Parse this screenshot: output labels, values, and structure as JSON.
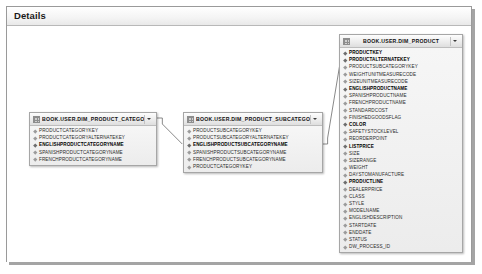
{
  "panel": {
    "title": "Details"
  },
  "icons": {
    "grid": "grid-icon",
    "caret": "chevron-down-icon",
    "field_marker": "field-marker-icon"
  },
  "colors": {
    "panel_border": "#9a9a9a",
    "entity_border": "#a6a6a6",
    "entity_header_start": "#fdfdfd",
    "entity_header_end": "#dedede",
    "entity_body": "#f2f2f2",
    "connector_line": "#6b6b6b",
    "text": "#2b2b2b",
    "key_text": "#000000"
  },
  "diagram": {
    "type": "entity-relationship",
    "entities": [
      {
        "id": "dim_product_category",
        "title": "BOOK.USER.DIM_PRODUCT_CATEGORY",
        "fields": [
          {
            "name": "PRODUCTCATEGORYKEY",
            "key": false
          },
          {
            "name": "PRODUCTCATEGORYALTERNATEKEY",
            "key": false
          },
          {
            "name": "ENGLISHPRODUCTCATEGORYNAME",
            "key": true
          },
          {
            "name": "SPANISHPRODUCTCATEGORYNAME",
            "key": false
          },
          {
            "name": "FRENCHPRODUCTCATEGORYNAME",
            "key": false
          }
        ]
      },
      {
        "id": "dim_product_subcategory",
        "title": "BOOK.USER.DIM_PRODUCT_SUBCATEGORY",
        "fields": [
          {
            "name": "PRODUCTSUBCATEGORYKEY",
            "key": false
          },
          {
            "name": "PRODUCTSUBCATEGORYALTERNATEKEY",
            "key": false
          },
          {
            "name": "ENGLISHPRODUCTSUBCATEGORYNAME",
            "key": true
          },
          {
            "name": "SPANISHPRODUCTSUBCATEGORYNAME",
            "key": false
          },
          {
            "name": "FRENCHPRODUCTSUBCATEGORYNAME",
            "key": false
          },
          {
            "name": "PRODUCTCATEGORYKEY",
            "key": false
          }
        ]
      },
      {
        "id": "dim_product",
        "title": "BOOK.USER.DIM_PRODUCT",
        "fields": [
          {
            "name": "PRODUCTKEY",
            "key": true
          },
          {
            "name": "PRODUCTALTERNATEKEY",
            "key": true
          },
          {
            "name": "PRODUCTSUBCATEGORYKEY",
            "key": false
          },
          {
            "name": "WEIGHTUNITMEASURECODE",
            "key": false
          },
          {
            "name": "SIZEUNITMEASURECODE",
            "key": false
          },
          {
            "name": "ENGLISHPRODUCTNAME",
            "key": true
          },
          {
            "name": "SPANISHPRODUCTNAME",
            "key": false
          },
          {
            "name": "FRENCHPRODUCTNAME",
            "key": false
          },
          {
            "name": "STANDARDCOST",
            "key": false
          },
          {
            "name": "FINISHEDGOODSFLAG",
            "key": false
          },
          {
            "name": "COLOR",
            "key": true
          },
          {
            "name": "SAFETYSTOCKLEVEL",
            "key": false
          },
          {
            "name": "REORDERPOINT",
            "key": false
          },
          {
            "name": "LISTPRICE",
            "key": true
          },
          {
            "name": "SIZE",
            "key": false
          },
          {
            "name": "SIZERANGE",
            "key": false
          },
          {
            "name": "WEIGHT",
            "key": false
          },
          {
            "name": "DAYSTOMANUFACTURE",
            "key": false
          },
          {
            "name": "PRODUCTLINE",
            "key": true
          },
          {
            "name": "DEALERPRICE",
            "key": false
          },
          {
            "name": "CLASS",
            "key": false
          },
          {
            "name": "STYLE",
            "key": false
          },
          {
            "name": "MODELNAME",
            "key": false
          },
          {
            "name": "ENGLISHDESCRIPTION",
            "key": false
          },
          {
            "name": "STARTDATE",
            "key": false
          },
          {
            "name": "ENDDATE",
            "key": false
          },
          {
            "name": "STATUS",
            "key": false
          },
          {
            "name": "DW_PROCESS_ID",
            "key": false
          }
        ]
      }
    ],
    "relationships": [
      {
        "from": "dim_product_category",
        "to": "dim_product_subcategory"
      },
      {
        "from": "dim_product_subcategory",
        "to": "dim_product"
      }
    ]
  }
}
